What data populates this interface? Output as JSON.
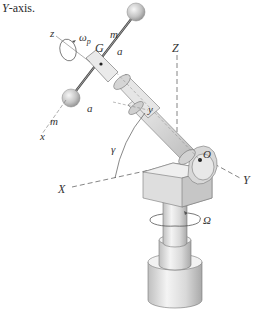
{
  "caption": {
    "italic_part": "Y",
    "rest": "-axis."
  },
  "labels": {
    "z": "z",
    "omega_p": "ω",
    "omega_p_sub": "p",
    "m_top": "m",
    "G": "G",
    "a_upper": "a",
    "a_lower": "a",
    "m_bottom": "m",
    "x": "x",
    "y": "y",
    "gamma": "γ",
    "Z": "Z",
    "X": "X",
    "Y": "Y",
    "O": "O",
    "Omega": "Ω"
  },
  "colors": {
    "line": "#555555",
    "sphere": "#bdbdbd",
    "metal_light": "#ececec",
    "metal_mid": "#cfcfcf",
    "metal_dark": "#9e9e9e"
  }
}
